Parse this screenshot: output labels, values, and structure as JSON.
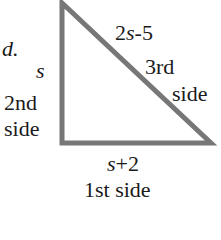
{
  "figure": {
    "part_label": "d.",
    "stroke_color": "#777777",
    "sides": {
      "first": {
        "expr_var": "s",
        "expr_rest": "+2",
        "name": "1st side"
      },
      "second": {
        "expr_var": "s",
        "name_line1": "2nd",
        "name_line2": "side"
      },
      "third": {
        "expr_pre": "2",
        "expr_var": "s",
        "expr_rest": "-5",
        "name_line1": "3rd",
        "name_line2": "side"
      }
    }
  }
}
